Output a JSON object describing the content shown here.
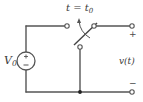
{
  "diagram": {
    "type": "circuit",
    "switch_label": {
      "base": "t = t",
      "sub": "0"
    },
    "source_label": {
      "base": "V",
      "sub": "0"
    },
    "source_polarity": {
      "plus": "+",
      "minus": "−"
    },
    "output_label": "v(t)",
    "output_plus": "+",
    "output_minus": "−",
    "colors": {
      "wire": "#555555",
      "text": "#3a3a3a",
      "background": "#ffffff"
    }
  }
}
